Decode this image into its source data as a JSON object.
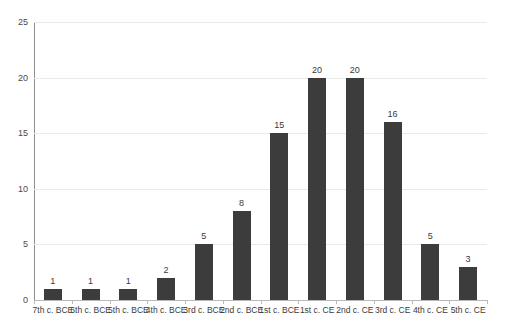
{
  "chart_data": {
    "type": "bar",
    "title": "",
    "xlabel": "",
    "ylabel": "",
    "ylim": [
      0,
      25
    ],
    "yticks": [
      0,
      5,
      10,
      15,
      20,
      25
    ],
    "grid": true,
    "legend": false,
    "bar_color": "#3c3c3c",
    "gridline_color": "#e9e9e9",
    "axis_color": "#8e8e8e",
    "background_color": "#ffffff",
    "show_value_labels": true,
    "categories": [
      "7th c. BCE",
      "6th c. BCE",
      "5th c. BCE",
      "4th c. BCE",
      "3rd c. BCE",
      "2nd c. BCE",
      "1st c. BCE",
      "1st c. CE",
      "2nd c. CE",
      "3rd c. CE",
      "4th c. CE",
      "5th c. CE"
    ],
    "values": [
      1,
      1,
      1,
      2,
      5,
      8,
      15,
      20,
      20,
      16,
      5,
      3
    ]
  }
}
